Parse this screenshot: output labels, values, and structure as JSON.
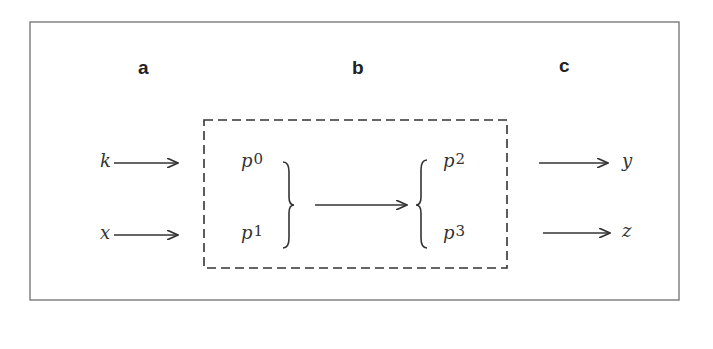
{
  "columns": {
    "a": "a",
    "b": "b",
    "c": "c"
  },
  "inputs": [
    {
      "var": "k"
    },
    {
      "var": "x"
    }
  ],
  "left_group": [
    {
      "sym": "p",
      "sub": "0"
    },
    {
      "sym": "p",
      "sub": "1"
    }
  ],
  "right_group": [
    {
      "sym": "p",
      "sub": "2"
    },
    {
      "sym": "p",
      "sub": "3"
    }
  ],
  "outputs": [
    {
      "var": "y"
    },
    {
      "var": "z"
    }
  ],
  "colors": {
    "stroke": "#333333",
    "frame": "#7a7a7a"
  }
}
